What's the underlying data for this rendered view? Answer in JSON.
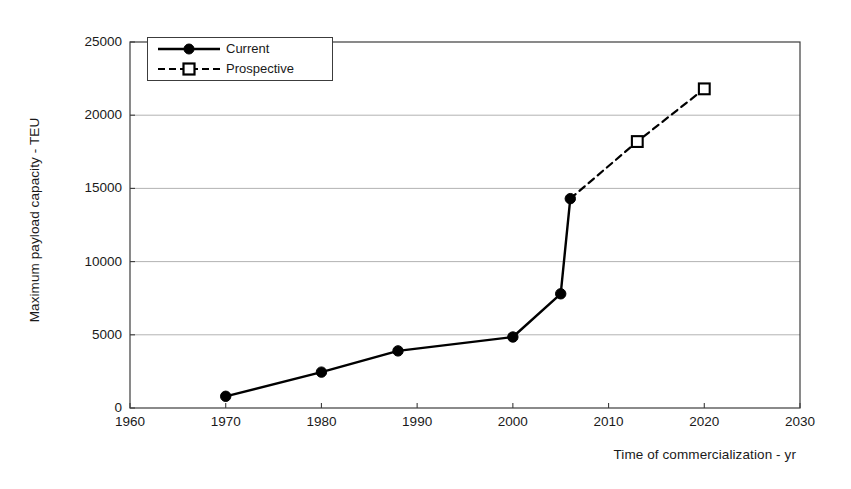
{
  "chart_data": {
    "type": "line",
    "title": "",
    "xlabel": "Time of commercialization - yr",
    "ylabel": "Maximum payload capacity - TEU",
    "xlim": [
      1960,
      2030
    ],
    "ylim": [
      0,
      25000
    ],
    "xticks": [
      1960,
      1970,
      1980,
      1990,
      2000,
      2010,
      2020,
      2030
    ],
    "xtick_labels": [
      "1960",
      "1970",
      "1980",
      "1990",
      "2000",
      "2010",
      "2020",
      "2030"
    ],
    "yticks": [
      0,
      5000,
      10000,
      15000,
      20000,
      25000
    ],
    "ytick_labels": [
      "0",
      "5000",
      "10000",
      "15000",
      "20000",
      "25000"
    ],
    "grid": {
      "horizontal": true,
      "vertical": false
    },
    "legend": {
      "position": "upper-left-inside",
      "entries": [
        {
          "name": "Current",
          "marker": "filled-circle",
          "line": "solid",
          "color": "#000000"
        },
        {
          "name": "Prospective",
          "marker": "open-square",
          "line": "dashed",
          "color": "#000000"
        }
      ]
    },
    "series": [
      {
        "name": "Current",
        "marker": "filled-circle",
        "line": "solid",
        "color": "#000000",
        "x": [
          1970,
          1980,
          1988,
          2000,
          2005,
          2006
        ],
        "y": [
          800,
          2450,
          3900,
          4850,
          7800,
          14300
        ]
      },
      {
        "name": "Prospective",
        "marker": "open-square",
        "line": "dashed",
        "color": "#000000",
        "x": [
          2006,
          2013,
          2020
        ],
        "y": [
          14300,
          18200,
          21800
        ],
        "note": "first point shared with Current series, drawn as connector"
      }
    ]
  },
  "axis": {
    "y_title": "Maximum payload capacity - TEU",
    "x_title": "Time of commercialization - yr"
  },
  "legend": {
    "entries": [
      {
        "label": "Current"
      },
      {
        "label": "Prospective"
      }
    ]
  },
  "colors": {
    "frame": "#3c3c3c",
    "grid": "#aaaaaa",
    "series": "#000000",
    "background": "#ffffff"
  }
}
